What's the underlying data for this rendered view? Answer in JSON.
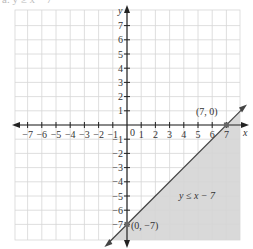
{
  "header": {
    "clipped_label": "a. y ≥ x − 7"
  },
  "chart_data": {
    "type": "line",
    "title": "",
    "xlabel": "x",
    "ylabel": "y",
    "xlim": [
      -8,
      8
    ],
    "ylim": [
      -8,
      8
    ],
    "grid": true,
    "x_ticks": [
      -7,
      -6,
      -5,
      -4,
      -3,
      -2,
      -1,
      1,
      2,
      3,
      4,
      5,
      6,
      7
    ],
    "y_ticks": [
      7,
      6,
      5,
      4,
      3,
      2,
      1,
      -1,
      -2,
      -3,
      -4,
      -5,
      -6,
      -7
    ],
    "origin_label": "0",
    "series": [
      {
        "name": "y = x − 7",
        "points": [
          [
            0,
            -7
          ],
          [
            7,
            0
          ]
        ],
        "style": "solid"
      }
    ],
    "shaded_region": {
      "inequality": "y ≤ x − 7",
      "side": "below-right",
      "color": "#d9d9d9"
    },
    "annotations": [
      {
        "text": "(7, 0)",
        "x": 7,
        "y": 0
      },
      {
        "text": "(0, −7)",
        "x": 0,
        "y": -7
      },
      {
        "text": "y ≤ x − 7",
        "x": 4.7,
        "y": -4.8
      }
    ]
  },
  "colors": {
    "grid": "#d6d6d6",
    "axis": "#222222",
    "shade": "#d9d9d9",
    "line": "#444444",
    "point": "#666666"
  }
}
